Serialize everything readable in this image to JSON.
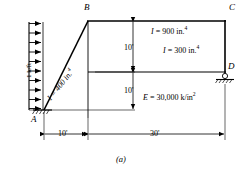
{
  "figure": {
    "caption": "(a)",
    "type": "structural-frame-diagram"
  },
  "nodes": [
    {
      "id": "A",
      "label": "A",
      "support": "pin",
      "x": 30,
      "y": 110
    },
    {
      "id": "B",
      "label": "B",
      "support": "none",
      "x": 88,
      "y": 21
    },
    {
      "id": "C",
      "label": "C",
      "support": "none",
      "x": 225,
      "y": 21
    },
    {
      "id": "D",
      "label": "D",
      "support": "roller",
      "x": 225,
      "y": 72
    }
  ],
  "load": {
    "label": "1 k/ft",
    "direction": "horizontal-right",
    "arrow_count": 10,
    "applied_to": "member-AB"
  },
  "members": [
    {
      "id": "AB",
      "label": "I = 400 in.",
      "exponent": "4",
      "label_full": "I = 400 in.4"
    },
    {
      "id": "BC",
      "label": "I = 900 in.",
      "exponent": "4",
      "label_full": "I = 900 in.4"
    },
    {
      "id": "CD",
      "label": "I = 300 in.",
      "exponent": "4",
      "label_full": "I = 300 in.4"
    }
  ],
  "material": {
    "label": "E = 30,000 k/in",
    "exponent": "2",
    "label_full": "E = 30,000 k/in2"
  },
  "dimensions": {
    "horizontal": [
      {
        "id": "dim-10ft-left",
        "label": "10'",
        "value": 10,
        "unit": "ft"
      },
      {
        "id": "dim-30ft-right",
        "label": "30'",
        "value": 30,
        "unit": "ft"
      }
    ],
    "vertical": [
      {
        "id": "dim-10ft-upper",
        "label": "10'",
        "value": 10,
        "unit": "ft"
      },
      {
        "id": "dim-10ft-lower",
        "label": "10'",
        "value": 10,
        "unit": "ft"
      }
    ]
  },
  "colors": {
    "line": "#000000",
    "background": "#ffffff"
  }
}
